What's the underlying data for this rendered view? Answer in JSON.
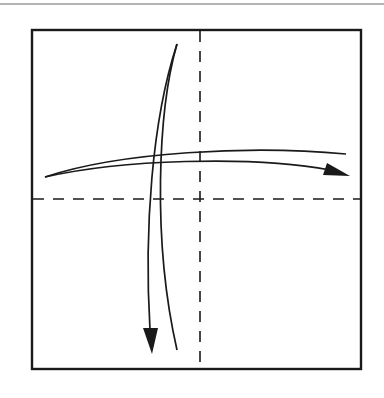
{
  "diagram": {
    "type": "origami-fold-diagram",
    "colors": {
      "background": "#ffffff",
      "ink": "#1a1a1a",
      "top_rule": "#b4b4b4"
    },
    "square": {
      "x": 32,
      "y": 30,
      "width": 329,
      "height": 339
    },
    "fold_lines": [
      {
        "id": "vertical-fold",
        "style": "dashed",
        "orientation": "vertical",
        "x": 200
      },
      {
        "id": "horizontal-fold",
        "style": "dashed",
        "orientation": "horizontal",
        "y": 199
      }
    ],
    "arrows": [
      {
        "id": "fold-right-arrow",
        "direction": "left-to-right",
        "meaning": "fold and unfold"
      },
      {
        "id": "fold-down-arrow",
        "direction": "top-to-bottom",
        "meaning": "fold and unfold"
      }
    ]
  }
}
